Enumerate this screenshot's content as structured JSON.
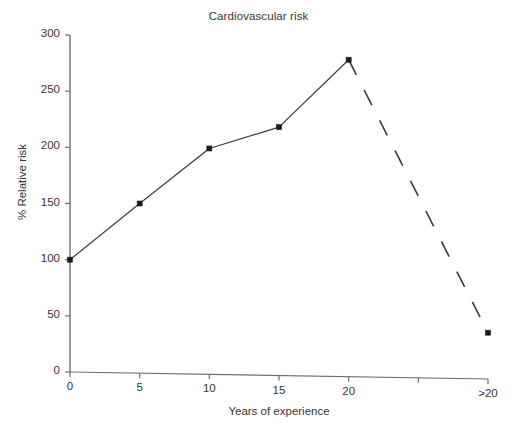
{
  "chart_data": {
    "type": "line",
    "title": "Cardiovascular risk",
    "xlabel": "Years of experience",
    "ylabel": "% Relative risk",
    "grid": false,
    "legend": null,
    "ylim": [
      0,
      300
    ],
    "yticks": [
      0,
      50,
      100,
      150,
      200,
      250,
      300
    ],
    "ytick_labels": [
      "0",
      "50",
      "100",
      "150",
      "200",
      "250",
      "300"
    ],
    "xtick_labels": [
      "0",
      "5",
      "10",
      "15",
      "20",
      "",
      ">20"
    ],
    "x": [
      "0",
      "5",
      "10",
      "15",
      "20",
      ">20"
    ],
    "values": [
      100,
      150,
      199,
      218,
      278,
      35
    ],
    "series": [
      {
        "name": "Relative risk",
        "categories": [
          "0",
          "5",
          "10",
          "15",
          "20",
          ">20"
        ],
        "values": [
          100,
          150,
          199,
          218,
          278,
          35
        ],
        "marker": "square",
        "solid_segment_end_index": 4,
        "dashed_segment_from_index": 4,
        "color": "#3a3a3a"
      }
    ],
    "annotations": []
  },
  "axes": {
    "y_axis_name": "y-axis",
    "x_axis_name": "x-axis"
  },
  "colors": {
    "line": "#3a3a3a",
    "marker": "#1a1a1a",
    "axis": "#6f6f6f",
    "text": "#343434",
    "background": "#ffffff"
  }
}
